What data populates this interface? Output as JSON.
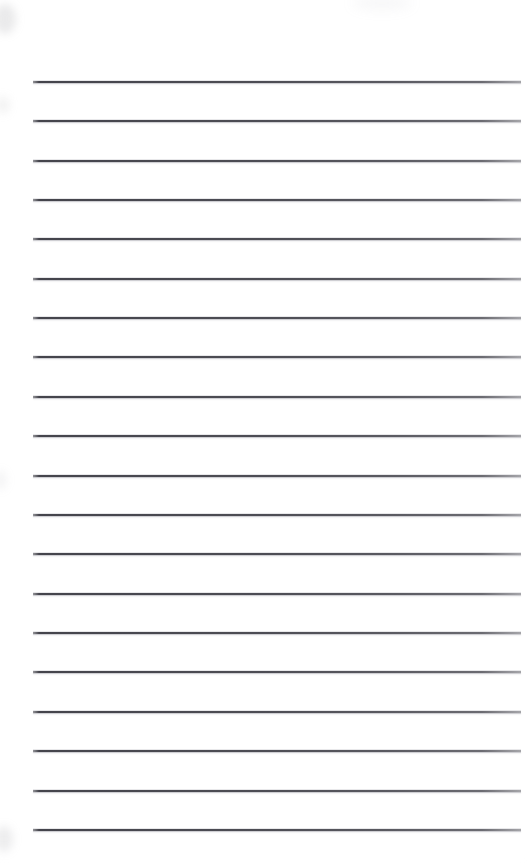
{
  "document": {
    "type": "scanned-lined-paper",
    "title": "Blank Lined Notepad Page",
    "content_text": "",
    "page_width": 527,
    "page_height": 863,
    "background_color": "#fdfdfd",
    "is_blank": "true"
  },
  "rules": {
    "count": 20,
    "line_color": "#3e3e46",
    "line_thickness": 1.5,
    "left_x": 33,
    "right_x": 521,
    "first_line_y": 81,
    "spacing": 39.45,
    "positions": [
      81,
      120,
      160,
      199,
      238,
      278,
      317,
      356,
      396,
      435,
      475,
      514,
      553,
      593,
      632,
      671,
      711,
      750,
      790,
      829
    ]
  },
  "artifacts": {
    "smudges": [
      {
        "name": "top-left-smudge",
        "x": -6,
        "y": 4
      },
      {
        "name": "upper-left-smudge",
        "x": -4,
        "y": 96
      },
      {
        "name": "mid-left-smudge",
        "x": -6,
        "y": 470
      },
      {
        "name": "bottom-left-smudge",
        "x": -5,
        "y": 826
      },
      {
        "name": "top-right-smudge",
        "x": 352,
        "y": -4
      }
    ]
  }
}
